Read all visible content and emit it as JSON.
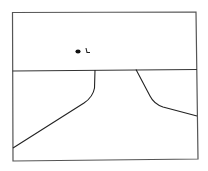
{
  "sketch": {
    "description": "Hand-drawn sketch: rectangular frame divided by a horizon line, with a road/path receding toward the horizon",
    "stroke_color": "#2a2a2a",
    "frame_color": "#555555",
    "mark": {
      "dot_label": "•",
      "glyph_label": "ʟ"
    }
  }
}
